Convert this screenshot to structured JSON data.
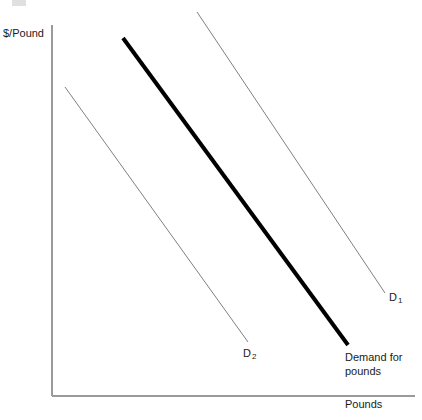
{
  "chart_data": {
    "type": "line",
    "title": "",
    "xlabel": "Pounds",
    "ylabel": "$/Pound",
    "grid": false,
    "legend_position": "inline-annotations",
    "axis_style": "open-L-axes-no-ticks",
    "xlim": [
      0,
      100
    ],
    "ylim": [
      0,
      100
    ],
    "series": [
      {
        "name": "D2",
        "label": "D",
        "subscript": "2",
        "emphasis": "thin",
        "color": "#808080",
        "width_px": 1,
        "description": "leftmost parallel demand curve, shifted left",
        "points": [
          {
            "x_px": 65,
            "y_px": 87
          },
          {
            "x_px": 248,
            "y_px": 342
          }
        ]
      },
      {
        "name": "Demand for pounds",
        "label": "Demand for pounds",
        "label_line_1": "Demand for",
        "label_line_2": "pounds",
        "emphasis": "bold",
        "color": "#000000",
        "width_px": 4,
        "description": "middle parallel demand curve, highlighted",
        "points": [
          {
            "x_px": 123,
            "y_px": 38
          },
          {
            "x_px": 348,
            "y_px": 345
          }
        ]
      },
      {
        "name": "D1",
        "label": "D",
        "subscript": "1",
        "emphasis": "thin",
        "color": "#808080",
        "width_px": 1,
        "description": "rightmost parallel demand curve, shifted right",
        "points": [
          {
            "x_px": 197,
            "y_px": 12
          },
          {
            "x_px": 385,
            "y_px": 293
          }
        ]
      }
    ],
    "axes": {
      "origin_px": {
        "x": 52,
        "y": 396
      },
      "y_axis_top_px": {
        "x": 52,
        "y": 25
      },
      "x_axis_right_px": {
        "x": 415,
        "y": 396
      },
      "color": "#9a9a9a",
      "width_px": 1
    }
  },
  "labels": {
    "y_axis_title": "$/Pound",
    "x_axis_title": "Pounds",
    "curve_d1_base": "D",
    "curve_d1_sub": "1",
    "curve_d2_base": "D",
    "curve_d2_sub": "2",
    "demand_line_1": "Demand for",
    "demand_line_2": "pounds"
  },
  "colors": {
    "background": "#ffffff",
    "axis": "#9a9a9a",
    "thin_curve": "#808080",
    "bold_curve": "#000000",
    "text": "#1a1a1a"
  }
}
